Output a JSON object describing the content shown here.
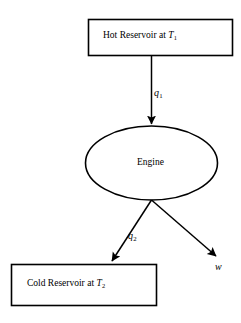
{
  "diagram": {
    "type": "heat-engine-schematic",
    "background_color": "#ffffff",
    "stroke_color": "#000000",
    "nodes": {
      "hot_reservoir": {
        "shape": "rectangle",
        "text_prefix": "Hot Reservoir at ",
        "symbol": "T",
        "subscript": "1",
        "full_text": "Hot Reservoir at T1"
      },
      "engine": {
        "shape": "ellipse",
        "label": "Engine"
      },
      "cold_reservoir": {
        "shape": "rectangle",
        "text_prefix": "Cold Reservoir at ",
        "symbol": "T",
        "subscript": "2",
        "full_text": "Cold Reservoir at T2"
      }
    },
    "edges": {
      "heat_in": {
        "symbol": "q",
        "subscript": "1",
        "full_text": "q1",
        "from": "hot_reservoir",
        "to": "engine",
        "direction": "down"
      },
      "heat_out": {
        "symbol": "q",
        "subscript": "2",
        "full_text": "q2",
        "from": "engine",
        "to": "cold_reservoir",
        "direction": "down-left"
      },
      "work_out": {
        "symbol": "w",
        "subscript": "",
        "full_text": "w",
        "from": "engine",
        "to": "",
        "direction": "down-right"
      }
    }
  }
}
